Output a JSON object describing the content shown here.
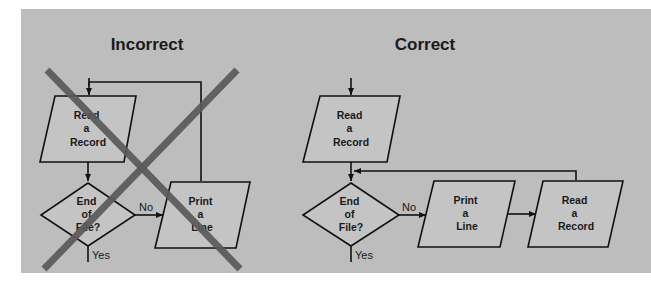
{
  "panels": {
    "incorrect": {
      "title": "Incorrect",
      "read_box": [
        "Read",
        "a",
        "Record"
      ],
      "decision": [
        "End",
        "of",
        "File?"
      ],
      "print_box": [
        "Print",
        "a",
        "Line"
      ],
      "no_label": "No",
      "yes_label": "Yes",
      "crossed_out": true
    },
    "correct": {
      "title": "Correct",
      "read_box": [
        "Read",
        "a",
        "Record"
      ],
      "decision": [
        "End",
        "of",
        "File?"
      ],
      "print_box": [
        "Print",
        "a",
        "Line"
      ],
      "read_box_2": [
        "Read",
        "a",
        "Record"
      ],
      "no_label": "No",
      "yes_label": "Yes"
    }
  },
  "colors": {
    "background": "#bdbdbd",
    "cross": "#5a5a5a",
    "stroke": "#111111"
  }
}
